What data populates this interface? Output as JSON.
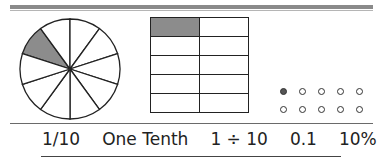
{
  "fraction": {
    "numerator": 1,
    "denominator": 10,
    "shaded_parts": 1
  },
  "pie": {
    "slices": 10,
    "shaded_index": 0,
    "shade_color": "#8c8c8c"
  },
  "grid": {
    "rows": 5,
    "cols": 2,
    "shaded_cells": [
      [
        0,
        0
      ]
    ]
  },
  "dots": {
    "rows": 2,
    "cols": 5,
    "filled_count": 1
  },
  "labels": {
    "fraction": "1/10",
    "words": "One Tenth",
    "division": "1 ÷ 10",
    "decimal": "0.1",
    "percent": "10%"
  }
}
